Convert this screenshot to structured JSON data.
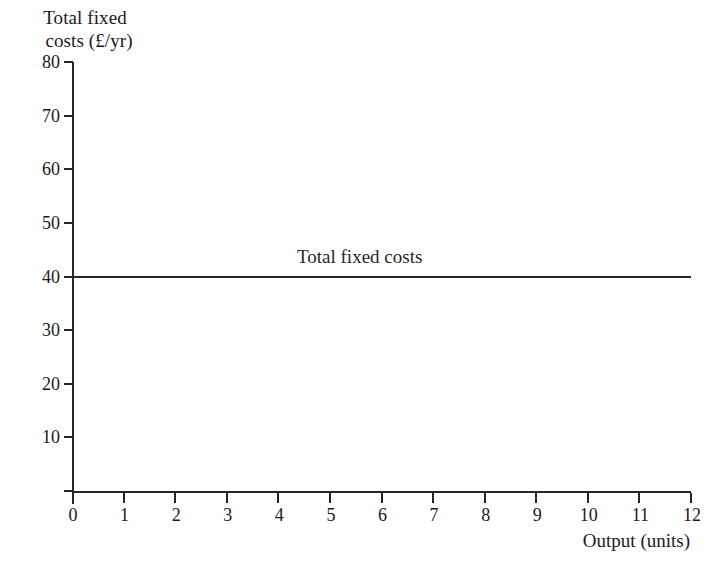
{
  "chart_data": {
    "type": "line",
    "title": "",
    "ylabel": "Total fixed costs (£/yr)",
    "ylabel_line1": "Total fixed",
    "ylabel_line2": "costs (£/yr)",
    "xlabel": "Output (units)",
    "xlim": [
      0,
      12
    ],
    "ylim": [
      0,
      80
    ],
    "x_ticks": [
      0,
      1,
      2,
      3,
      4,
      5,
      6,
      7,
      8,
      9,
      10,
      11,
      12
    ],
    "y_ticks": [
      0,
      10,
      20,
      30,
      40,
      50,
      60,
      70,
      80
    ],
    "x_tick_labels": [
      "0",
      "1",
      "2",
      "3",
      "4",
      "5",
      "6",
      "7",
      "8",
      "9",
      "10",
      "11",
      "12"
    ],
    "y_tick_labels": [
      "",
      "10",
      "20",
      "30",
      "40",
      "50",
      "60",
      "70",
      "80"
    ],
    "grid": false,
    "legend": "none",
    "series": [
      {
        "name": "Total fixed costs",
        "annotation": "Total fixed costs",
        "color": "#262626",
        "x": [
          0,
          1,
          2,
          3,
          4,
          5,
          6,
          7,
          8,
          9,
          10,
          11,
          12
        ],
        "values": [
          40,
          40,
          40,
          40,
          40,
          40,
          40,
          40,
          40,
          40,
          40,
          40,
          40
        ],
        "constant_value": 40
      }
    ]
  },
  "style": {
    "background": "#ffffff",
    "axis_color": "#262626",
    "text_color": "#1a1a1a"
  }
}
